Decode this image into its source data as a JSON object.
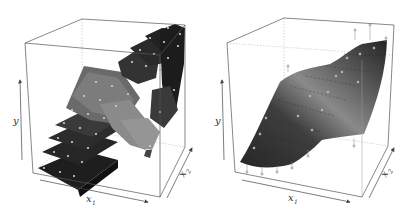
{
  "figure": {
    "panels": [
      {
        "id": "left",
        "description": "Piecewise-constant (step) regression surface over a grid in (x1, x2), rendered as 3D blocks; data points shown as light dots on block tops",
        "surface_type": "step-blocks",
        "axes": {
          "y_label": "y",
          "x1_label": "x",
          "x1_sub": "1",
          "x2_label": "x",
          "x2_sub": "2"
        }
      },
      {
        "id": "right",
        "description": "Smooth fitted regression surface over (x1, x2) with data points attached via vertical stems",
        "surface_type": "smooth-surface",
        "axes": {
          "y_label": "y",
          "x1_label": "x",
          "x1_sub": "1",
          "x2_label": "x",
          "x2_sub": "2"
        }
      }
    ]
  },
  "colors": {
    "box_edge": "#555555",
    "box_back_edge": "#b0b0b0",
    "surface_dark": "#262626",
    "surface_mid": "#6e6e6e",
    "surface_light": "#a0a0a0",
    "point": "#c8c8c8"
  }
}
